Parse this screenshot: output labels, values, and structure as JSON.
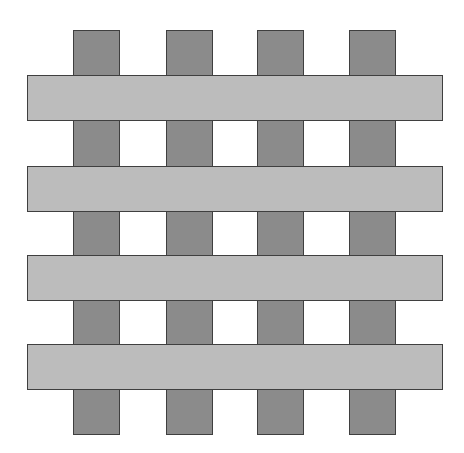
{
  "diagram": {
    "title": "Plain weave pattern",
    "type": "woven lattice",
    "colors": {
      "background": "#ffffff",
      "warp_fill": "#8b8b8b",
      "weft_fill": "#bcbcbc",
      "outline": "#3f3f3f"
    },
    "warp_strips": [
      {
        "id": "warp-1",
        "x": 73,
        "y": 30,
        "w": 47,
        "h": 405
      },
      {
        "id": "warp-2",
        "x": 166,
        "y": 30,
        "w": 47,
        "h": 405
      },
      {
        "id": "warp-3",
        "x": 257,
        "y": 30,
        "w": 47,
        "h": 405
      },
      {
        "id": "warp-4",
        "x": 349,
        "y": 30,
        "w": 47,
        "h": 405
      }
    ],
    "weft_strips": [
      {
        "id": "weft-1",
        "x": 27,
        "y": 75,
        "w": 416,
        "h": 46
      },
      {
        "id": "weft-2",
        "x": 27,
        "y": 166,
        "w": 416,
        "h": 46
      },
      {
        "id": "weft-3",
        "x": 27,
        "y": 255,
        "w": 416,
        "h": 46
      },
      {
        "id": "weft-4",
        "x": 27,
        "y": 344,
        "w": 416,
        "h": 46
      }
    ]
  }
}
